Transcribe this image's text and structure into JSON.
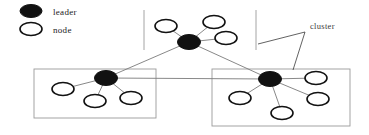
{
  "figure": {
    "width": 369,
    "height": 135,
    "background": "#ffffff",
    "node_stroke": "#111111",
    "leader_fill": "#111111",
    "edge_color": "#7a7a7a",
    "box_color": "#9a9a9a",
    "annotation_color": "#3a3a3a"
  },
  "legend": {
    "items": [
      {
        "label": "leader",
        "symbol": "filled-ellipse",
        "cx": 31,
        "cy": 11,
        "rx": 11,
        "ry": 6.5
      },
      {
        "label": "node",
        "symbol": "hollow-ellipse",
        "cx": 31,
        "cy": 29,
        "rx": 11,
        "ry": 6.5
      }
    ]
  },
  "annotations": [
    {
      "label": "cluster",
      "text_x": 310,
      "text_y": 29,
      "pointer_from_x": 305,
      "pointer_from_y": 32,
      "pointer_to_x": 258,
      "pointer_to_y": 44
    }
  ],
  "clusters": [
    {
      "id": "cluster-top",
      "box": {
        "x": 144,
        "y": 10,
        "width": 112,
        "height": 40,
        "style": "open-sides"
      },
      "leader": {
        "id": "leader-top",
        "cx": 189,
        "cy": 42,
        "rx": 11.5,
        "ry": 7.5
      },
      "nodes": [
        {
          "id": "node-top-1",
          "cx": 166,
          "cy": 26,
          "rx": 11,
          "ry": 6.5
        },
        {
          "id": "node-top-2",
          "cx": 214,
          "cy": 22,
          "rx": 11,
          "ry": 6.5
        },
        {
          "id": "node-top-3",
          "cx": 226,
          "cy": 38,
          "rx": 11,
          "ry": 6.5
        }
      ]
    },
    {
      "id": "cluster-left",
      "box": {
        "x": 34,
        "y": 69,
        "width": 122,
        "height": 49,
        "style": "full"
      },
      "leader": {
        "id": "leader-left",
        "cx": 106,
        "cy": 78,
        "rx": 11.5,
        "ry": 7.5
      },
      "nodes": [
        {
          "id": "node-left-1",
          "cx": 63,
          "cy": 89,
          "rx": 11,
          "ry": 6.5
        },
        {
          "id": "node-left-2",
          "cx": 95,
          "cy": 101,
          "rx": 11,
          "ry": 6.5
        },
        {
          "id": "node-left-3",
          "cx": 131,
          "cy": 98,
          "rx": 11,
          "ry": 6.5
        }
      ]
    },
    {
      "id": "cluster-right",
      "box": {
        "x": 212,
        "y": 69,
        "width": 138,
        "height": 57,
        "style": "full"
      },
      "leader": {
        "id": "leader-right",
        "cx": 270,
        "cy": 79,
        "rx": 11.5,
        "ry": 7.5
      },
      "nodes": [
        {
          "id": "node-right-1",
          "cx": 316,
          "cy": 78,
          "rx": 11,
          "ry": 6.5
        },
        {
          "id": "node-right-2",
          "cx": 240,
          "cy": 98,
          "rx": 11,
          "ry": 6.5
        },
        {
          "id": "node-right-3",
          "cx": 318,
          "cy": 99,
          "rx": 11,
          "ry": 6.5
        },
        {
          "id": "node-right-4",
          "cx": 282,
          "cy": 113,
          "rx": 11,
          "ry": 6.5
        }
      ]
    }
  ],
  "inter_cluster_edges": [
    {
      "from": "leader-top",
      "to": "leader-left",
      "x1": 189,
      "y1": 42,
      "x2": 106,
      "y2": 78
    },
    {
      "from": "leader-top",
      "to": "leader-right",
      "x1": 189,
      "y1": 42,
      "x2": 270,
      "y2": 79
    },
    {
      "from": "leader-left",
      "to": "leader-right",
      "x1": 106,
      "y1": 78,
      "x2": 270,
      "y2": 79
    }
  ],
  "intra_cluster_edges": [
    {
      "x1": 189,
      "y1": 42,
      "x2": 166,
      "y2": 26
    },
    {
      "x1": 189,
      "y1": 42,
      "x2": 214,
      "y2": 22
    },
    {
      "x1": 189,
      "y1": 42,
      "x2": 226,
      "y2": 38
    },
    {
      "x1": 106,
      "y1": 78,
      "x2": 63,
      "y2": 89
    },
    {
      "x1": 106,
      "y1": 78,
      "x2": 95,
      "y2": 101
    },
    {
      "x1": 106,
      "y1": 78,
      "x2": 131,
      "y2": 98
    },
    {
      "x1": 270,
      "y1": 79,
      "x2": 316,
      "y2": 78
    },
    {
      "x1": 270,
      "y1": 79,
      "x2": 240,
      "y2": 98
    },
    {
      "x1": 270,
      "y1": 79,
      "x2": 318,
      "y2": 99
    },
    {
      "x1": 270,
      "y1": 79,
      "x2": 282,
      "y2": 113
    }
  ]
}
